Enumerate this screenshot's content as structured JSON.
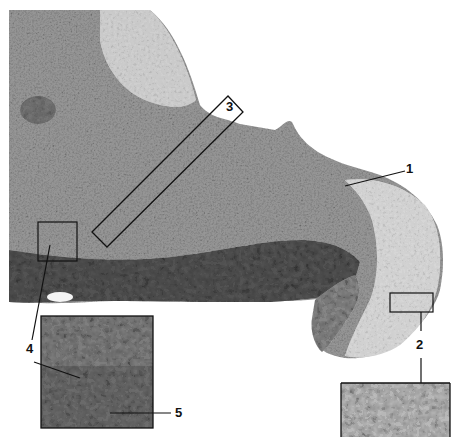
{
  "figure": {
    "type": "grayscale histology micrograph with callouts",
    "background": "#ffffff",
    "tissue_colors": {
      "dark_nuclei": "#2a2a2a",
      "mid_tissue": "#8a8a8a",
      "light_tissue": "#c8c8c8",
      "pale_keratin": "#dcdcdc"
    },
    "labels": [
      {
        "id": "1",
        "text": "1",
        "x": 406,
        "y": 162
      },
      {
        "id": "2",
        "text": "2",
        "x": 416,
        "y": 338
      },
      {
        "id": "3",
        "text": "3",
        "x": 226,
        "y": 100
      },
      {
        "id": "4",
        "text": "4",
        "x": 26,
        "y": 342
      },
      {
        "id": "5",
        "text": "5",
        "x": 175,
        "y": 406
      }
    ],
    "callout_boxes": [
      {
        "id": "box-3",
        "shape": "rotated-rectangle",
        "description": "oblique strip through epithelium"
      },
      {
        "id": "box-4",
        "shape": "rectangle",
        "x": 38,
        "y": 222,
        "w": 39,
        "h": 39
      },
      {
        "id": "box-2",
        "shape": "rectangle",
        "x": 390,
        "y": 293,
        "w": 43,
        "h": 19
      }
    ],
    "insets": [
      {
        "id": "inset-4-5",
        "x": 41,
        "y": 316,
        "w": 112,
        "h": 112,
        "description": "magnified basal layer region"
      },
      {
        "id": "inset-2",
        "x": 341,
        "y": 383,
        "w": 109,
        "h": 54,
        "description": "magnified superficial layer region"
      }
    ]
  }
}
